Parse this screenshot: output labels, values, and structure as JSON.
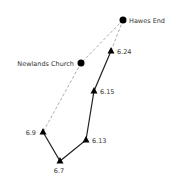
{
  "diagram": {
    "type": "route-map",
    "colors": {
      "line": "#222222",
      "dashed": "#888888",
      "marker": "#000000",
      "text": "#333333"
    },
    "places": [
      {
        "id": "hawes-end",
        "label": "Hawes End",
        "x": 123,
        "y": 20
      },
      {
        "id": "newlands-church",
        "label": "Newlands Church",
        "x": 81,
        "y": 63
      }
    ],
    "waypoints": [
      {
        "id": "wp-6-24",
        "label": "6.24",
        "x": 111,
        "y": 51
      },
      {
        "id": "wp-6-15",
        "label": "6.15",
        "x": 94,
        "y": 91
      },
      {
        "id": "wp-6-13",
        "label": "6.13",
        "x": 86,
        "y": 140
      },
      {
        "id": "wp-6-9",
        "label": "6.9",
        "x": 43,
        "y": 132
      },
      {
        "id": "wp-6-7",
        "label": "6.7",
        "x": 60,
        "y": 161
      }
    ],
    "solid_path": [
      "6.24",
      "6.15",
      "6.13",
      "6.7",
      "6.9"
    ],
    "dashed_paths": [
      [
        "Hawes End",
        "Newlands Church",
        "6.9"
      ],
      [
        "Hawes End",
        "6.24"
      ]
    ]
  }
}
